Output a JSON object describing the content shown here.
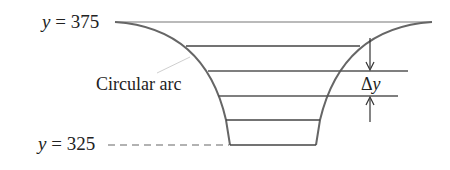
{
  "diagram": {
    "labels": {
      "top_var": "y",
      "top_eq": " = 375",
      "bottom_var": "y",
      "bottom_eq": " = 325",
      "arc_label": "Circular arc",
      "delta_symbol": "Δ",
      "delta_var": "y"
    },
    "levels": {
      "top": 375,
      "bottom": 325
    },
    "colors": {
      "stroke": "#555555",
      "text": "#222222",
      "leader": "#cccccc"
    }
  }
}
